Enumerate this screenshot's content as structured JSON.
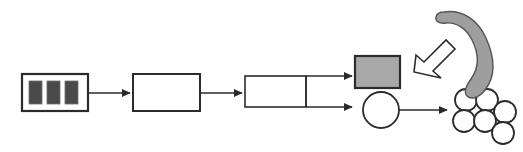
{
  "diagram": {
    "type": "process-flow",
    "canvas": {
      "width": 523,
      "height": 152,
      "background": "#ffffff"
    },
    "colors": {
      "stroke": "#2b2b2b",
      "stroke_light": "#3a3a3a",
      "fill_white": "#ffffff",
      "fill_gray": "#a8a8a8",
      "fill_dark_bar": "#4a4a4a",
      "fill_crescent": "#9e9e9e",
      "fill_hollow_arrow": "#ffffff"
    },
    "nodes": [
      {
        "id": "striped-block",
        "name": "striped-source-block",
        "shape": "rectangle",
        "fill": "#ffffff",
        "x": 22,
        "y": 74,
        "width": 66,
        "height": 37,
        "stroke_width": 2.2,
        "bars": {
          "count": 3,
          "fill": "#4a4a4a",
          "width": 13,
          "height": 23,
          "gap": 5,
          "inset_x": 6,
          "inset_y": 7
        },
        "label": ""
      },
      {
        "id": "empty-block-1",
        "name": "empty-process-block",
        "shape": "rectangle",
        "fill": "#ffffff",
        "x": 133,
        "y": 74,
        "width": 67,
        "height": 37,
        "stroke_width": 2.0,
        "label": ""
      },
      {
        "id": "split-block",
        "name": "split-stage-block",
        "shape": "rectangle",
        "fill": "#ffffff",
        "x": 245,
        "y": 76,
        "width": 61,
        "height": 31,
        "stroke_width": 1.6,
        "divider_x": 306,
        "label": ""
      },
      {
        "id": "gray-block",
        "name": "gray-output-block",
        "shape": "rectangle",
        "fill": "#a8a8a8",
        "x": 355,
        "y": 56,
        "width": 45,
        "height": 32,
        "stroke_width": 2.2,
        "label": ""
      },
      {
        "id": "circle-node",
        "name": "circle-output-node",
        "shape": "circle",
        "fill": "#ffffff",
        "cx": 381,
        "cy": 110,
        "r": 18,
        "stroke_width": 1.8,
        "label": ""
      },
      {
        "id": "circle-cluster",
        "name": "circle-cluster-output",
        "shape": "circle-cluster",
        "fill": "#ffffff",
        "stroke_width": 1.8,
        "circle_radius": 11,
        "circles": [
          {
            "cx": 466,
            "cy": 100
          },
          {
            "cx": 487,
            "cy": 100
          },
          {
            "cx": 505,
            "cy": 112
          },
          {
            "cx": 464,
            "cy": 121
          },
          {
            "cx": 485,
            "cy": 121
          },
          {
            "cx": 503,
            "cy": 133
          }
        ],
        "label": ""
      },
      {
        "id": "crescent",
        "name": "gray-crescent-shape",
        "shape": "crescent",
        "fill": "#9e9e9e",
        "stroke_width": 1.6,
        "label": ""
      },
      {
        "id": "hollow-arrow",
        "name": "hollow-pointer-arrow",
        "shape": "block-arrow",
        "fill": "#ffffff",
        "direction": "down-left",
        "stroke_width": 1.6,
        "label": ""
      }
    ],
    "connectors": [
      {
        "id": "c1",
        "name": "arrow-striped-to-empty",
        "from": "striped-block",
        "to": "empty-block-1",
        "x1": 89,
        "y1": 93,
        "x2": 131,
        "y2": 93,
        "style": "solid-arrow"
      },
      {
        "id": "c2",
        "name": "arrow-empty-to-split",
        "from": "empty-block-1",
        "to": "split-block",
        "x1": 201,
        "y1": 93,
        "x2": 243,
        "y2": 93,
        "style": "solid-arrow"
      },
      {
        "id": "c3",
        "name": "arrow-split-to-gray-block",
        "from": "split-block",
        "to": "gray-block",
        "x1": 306,
        "y1": 76,
        "x2": 353,
        "y2": 76,
        "style": "solid-arrow"
      },
      {
        "id": "c4",
        "name": "arrow-split-to-circle",
        "from": "split-block",
        "to": "circle-node",
        "x1": 306,
        "y1": 107,
        "x2": 353,
        "y2": 107,
        "style": "solid-arrow"
      },
      {
        "id": "c5",
        "name": "arrow-circle-to-cluster",
        "from": "circle-node",
        "to": "circle-cluster",
        "x1": 400,
        "y1": 110,
        "x2": 448,
        "y2": 110,
        "style": "solid-arrow"
      },
      {
        "id": "c6",
        "name": "divider-riser",
        "from": "split-block",
        "to": "split-block",
        "x1": 306,
        "y1": 76,
        "x2": 306,
        "y2": 107,
        "style": "plain-line"
      }
    ],
    "annotations": []
  }
}
